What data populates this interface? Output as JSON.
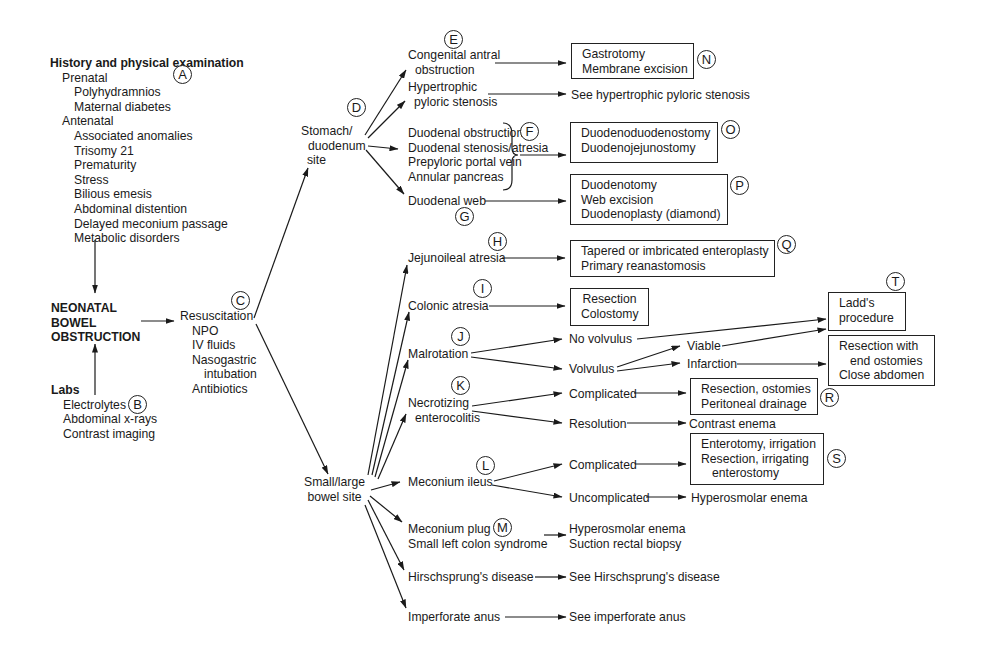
{
  "diagram": {
    "history": {
      "title": "History and physical examination",
      "prenatal_label": "Prenatal",
      "prenatal_items": [
        "Polyhydramnios",
        "Maternal diabetes"
      ],
      "antenatal_label": "Antenatal",
      "antenatal_items": [
        "Associated anomalies",
        "Trisomy 21",
        "Prematurity",
        "Stress",
        "Bilious emesis",
        "Abdominal distention",
        "Delayed meconium passage",
        "Metabolic disorders"
      ],
      "marker": "A"
    },
    "central": {
      "lines": [
        "NEONATAL",
        "BOWEL",
        "OBSTRUCTION"
      ]
    },
    "labs": {
      "title": "Labs",
      "items": [
        "Electrolytes",
        "Abdominal x-rays",
        "Contrast imaging"
      ],
      "marker": "B"
    },
    "resuscitation": {
      "title": "Resuscitation",
      "items": [
        "NPO",
        "IV fluids",
        "Nasogastric",
        "intubation",
        "Antibiotics"
      ],
      "marker": "C"
    },
    "stomach_site": {
      "lines": [
        "Stomach/",
        "duodenum",
        "site"
      ],
      "marker": "D"
    },
    "bowel_site": {
      "lines": [
        "Small/large",
        "bowel site"
      ]
    },
    "stomach_branches": {
      "antral": {
        "lines": [
          "Congenital antral",
          "obstruction"
        ],
        "marker": "E"
      },
      "pyloric": {
        "lines": [
          "Hypertrophic",
          "pyloric stenosis"
        ],
        "target": "See hypertrophic pyloric stenosis"
      },
      "duodenal_group": {
        "lines": [
          "Duodenal obstruction",
          "Duodenal stenosis/atresia",
          "Prepyloric portal vein",
          "Annular pancreas"
        ],
        "marker": "F"
      },
      "web": {
        "label": "Duodenal web",
        "marker": "G"
      }
    },
    "stomach_treatments": {
      "N": {
        "lines": [
          "Gastrotomy",
          "Membrane excision"
        ],
        "marker": "N"
      },
      "O": {
        "lines": [
          "Duodenoduodenostomy",
          "Duodenojejunostomy"
        ],
        "marker": "O"
      },
      "P": {
        "lines": [
          "Duodenotomy",
          "Web excision",
          "Duodenoplasty (diamond)"
        ],
        "marker": "P"
      }
    },
    "bowel_branches": {
      "jejunoileal": {
        "label": "Jejunoileal atresia",
        "marker": "H"
      },
      "colonic": {
        "label": "Colonic atresia",
        "marker": "I"
      },
      "malrotation": {
        "label": "Malrotation",
        "marker": "J",
        "no_volvulus": "No volvulus",
        "volvulus": "Volvulus",
        "viable": "Viable",
        "infarction": "Infarction"
      },
      "nec": {
        "lines": [
          "Necrotizing",
          "enterocolitis"
        ],
        "marker": "K",
        "complicated": "Complicated",
        "resolution": "Resolution",
        "resolution_target": "Contrast enema"
      },
      "meconium_ileus": {
        "label": "Meconium ileus",
        "marker": "L",
        "complicated": "Complicated",
        "uncomplicated": "Uncomplicated",
        "uncomplicated_target": "Hyperosmolar enema"
      },
      "meconium_plug": {
        "lines": [
          "Meconium plug",
          "Small left colon syndrome"
        ],
        "marker": "M",
        "targets": [
          "Hyperosmolar enema",
          "Suction rectal biopsy"
        ]
      },
      "hirschsprung": {
        "label": "Hirschsprung's disease",
        "target": "See Hirschsprung's disease"
      },
      "imperforate": {
        "label": "Imperforate anus",
        "target": "See imperforate anus"
      }
    },
    "bowel_treatments": {
      "Q": {
        "lines": [
          "Tapered or imbricated enteroplasty",
          "Primary reanastomosis"
        ],
        "marker": "Q"
      },
      "colonic_box": {
        "lines": [
          "Resection",
          "Colostomy"
        ]
      },
      "T": {
        "lines": [
          "Ladd's",
          "procedure"
        ],
        "marker": "T"
      },
      "infarction_box": {
        "lines": [
          "Resection with",
          "end ostomies",
          "Close abdomen"
        ]
      },
      "R": {
        "lines": [
          "Resection, ostomies",
          "Peritoneal drainage"
        ],
        "marker": "R"
      },
      "S": {
        "lines": [
          "Enterotomy, irrigation",
          "Resection, irrigating",
          "enterostomy"
        ],
        "marker": "S"
      }
    }
  }
}
